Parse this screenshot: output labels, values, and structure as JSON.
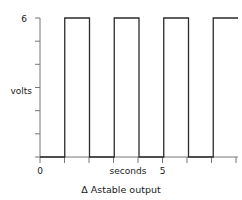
{
  "chart_data": {
    "type": "line",
    "title": "",
    "caption": "Δ Astable output",
    "caption_symbol": "Δ",
    "caption_text": "Astable output",
    "xlabel": "seconds",
    "ylabel": "volts",
    "ylim": [
      0,
      6
    ],
    "xlim": [
      0,
      8
    ],
    "grid": false,
    "legend": null,
    "y_ticks": [
      0,
      1,
      2,
      3,
      4,
      5,
      6
    ],
    "y_tick_labels": [
      "",
      "",
      "",
      "",
      "",
      "",
      "6"
    ],
    "y_labeled_value": "6",
    "x_ticks": [
      0,
      1,
      2,
      3,
      4,
      5,
      6,
      7,
      8
    ],
    "x_tick_labels": [
      "0",
      "",
      "",
      "",
      "",
      "5",
      "",
      "",
      ""
    ],
    "x_labeled_values": [
      "0",
      "5"
    ],
    "series": [
      {
        "name": "astable output",
        "description": "square wave, 6 V amplitude, period 2 s, 50% duty, first rising edge at t=1",
        "amplitude_volts": 6,
        "low_volts": 0,
        "period_seconds": 2,
        "duty_cycle_percent": 50,
        "first_rising_edge_seconds": 1,
        "points": [
          [
            0,
            0
          ],
          [
            1,
            0
          ],
          [
            1,
            6
          ],
          [
            2,
            6
          ],
          [
            2,
            0
          ],
          [
            3,
            0
          ],
          [
            3,
            6
          ],
          [
            4,
            6
          ],
          [
            4,
            0
          ],
          [
            5,
            0
          ],
          [
            5,
            6
          ],
          [
            6,
            6
          ],
          [
            6,
            0
          ],
          [
            7,
            0
          ],
          [
            7,
            6
          ],
          [
            8,
            6
          ]
        ]
      }
    ]
  },
  "labels": {
    "y_value_6": "6",
    "y_axis_name": "volts",
    "x_value_0": "0",
    "x_value_5": "5",
    "x_axis_name": "seconds",
    "caption": "Δ Astable output"
  },
  "colors": {
    "background": "#ffffff",
    "axis": "#777777",
    "trace": "#2b2b2b",
    "text": "#1a1a1a"
  }
}
